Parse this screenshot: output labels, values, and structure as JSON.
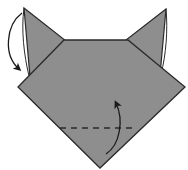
{
  "diagram": {
    "type": "origami-instruction",
    "colors": {
      "paper": "#8e8e8e",
      "outline": "#2a2a2a",
      "background": "#ffffff",
      "arrow": "#1a1a1a"
    },
    "elements": [
      {
        "name": "head-body",
        "shape": "folded paper pentagon"
      },
      {
        "name": "left-ear",
        "shape": "triangle"
      },
      {
        "name": "right-ear",
        "shape": "triangle"
      },
      {
        "name": "left-ear-fold-arrow",
        "meaning": "fold ear down/outward"
      },
      {
        "name": "valley-fold-line",
        "style": "dashed"
      },
      {
        "name": "fold-up-arrow",
        "meaning": "fold bottom tip up"
      }
    ]
  }
}
